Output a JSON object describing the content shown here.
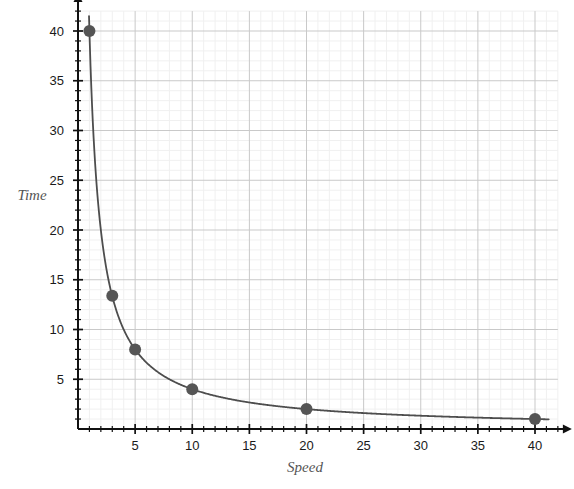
{
  "chart_data": {
    "type": "line",
    "title": "",
    "subtitle": "",
    "xlabel": "Speed",
    "ylabel": "Time",
    "relation": "Time = 40 / Speed",
    "xlim": [
      0,
      42
    ],
    "ylim": [
      0,
      42
    ],
    "xticks": [
      5,
      10,
      15,
      20,
      25,
      30,
      35,
      40
    ],
    "yticks": [
      5,
      10,
      15,
      20,
      25,
      30,
      35,
      40
    ],
    "xtick_labels": [
      "5",
      "10",
      "15",
      "20",
      "25",
      "30",
      "35",
      "40"
    ],
    "ytick_labels": [
      "5",
      "10",
      "15",
      "20",
      "25",
      "30",
      "35",
      "40"
    ],
    "x_minor_step": 1,
    "y_minor_step": 1,
    "grid": true,
    "grid_major_color": "#c9c9c9",
    "grid_minor_color": "#f0f0f0",
    "axis_color": "#111111",
    "curve_color": "#4d4d4d",
    "marker_color": "#555555",
    "marker_radius": 6,
    "legend": null,
    "legend_position": "none",
    "series": [
      {
        "name": "Time vs Speed",
        "marker_points": [
          {
            "x": 1,
            "y": 40
          },
          {
            "x": 3,
            "y": 13.4
          },
          {
            "x": 5,
            "y": 8
          },
          {
            "x": 10,
            "y": 4
          },
          {
            "x": 20,
            "y": 2
          },
          {
            "x": 40,
            "y": 1
          }
        ]
      }
    ]
  }
}
